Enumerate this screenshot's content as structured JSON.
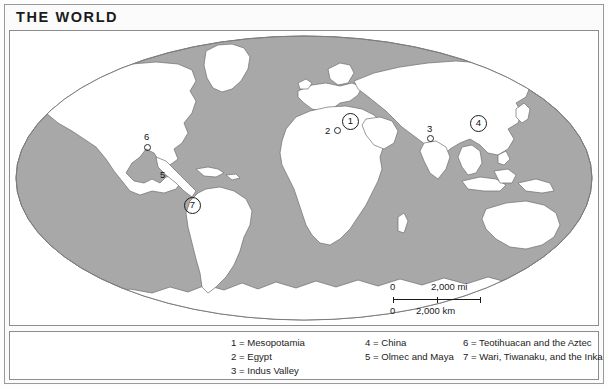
{
  "figure": {
    "title": "THE WORLD"
  },
  "scale": {
    "miles": {
      "zero": "0",
      "value": "2,000 mi"
    },
    "kilometers": {
      "zero": "0",
      "value": "2,000 km"
    }
  },
  "legend": {
    "column_1": [
      "1 = Mesopotamia",
      "2 = Egypt",
      "3 = Indus Valley"
    ],
    "column_2": [
      "4 = China",
      "5 = Olmec and Maya"
    ],
    "column_3": [
      "6 = Teotihuacan and the Aztec",
      "7 = Wari, Tiwanaku, and the Inka"
    ]
  },
  "markers": [
    {
      "id": "1",
      "label": "1",
      "style": "circled"
    },
    {
      "id": "2",
      "label": "2",
      "style": "plain"
    },
    {
      "id": "3",
      "label": "3",
      "style": "plain"
    },
    {
      "id": "4",
      "label": "4",
      "style": "circled"
    },
    {
      "id": "5",
      "label": "5",
      "style": "plain"
    },
    {
      "id": "6",
      "label": "6",
      "style": "plain"
    },
    {
      "id": "7",
      "label": "7",
      "style": "circled"
    }
  ],
  "colors": {
    "ocean": "#a8a8a8",
    "land": "#ffffff",
    "coastline": "#6f6f6f",
    "frame": "#8d8d8d",
    "text": "#1b1b1b"
  }
}
